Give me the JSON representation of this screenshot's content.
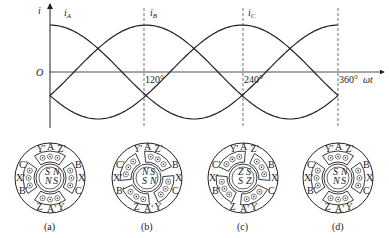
{
  "waveform": {
    "y_axis_label": "i",
    "x_axis_label": "ωt",
    "origin_label": "O",
    "curves": [
      {
        "name": "i_A",
        "label_main": "i",
        "label_sub": "A",
        "phase_deg": 0
      },
      {
        "name": "i_B",
        "label_main": "i",
        "label_sub": "B",
        "phase_deg": 120
      },
      {
        "name": "i_C",
        "label_main": "i",
        "label_sub": "C",
        "phase_deg": 240
      }
    ],
    "ticks": [
      "120°",
      "240°",
      "360°"
    ],
    "color": "#222222"
  },
  "motors": [
    {
      "caption": "(a)",
      "rotor_labels": [
        "S",
        "N",
        "N",
        "S"
      ],
      "stator_labels": {
        "top_left": "Y'",
        "top": "A",
        "top_right": "Z'",
        "right_top": "B",
        "right": "X",
        "right_bottom": "C",
        "bottom_right": "Y",
        "bottom": "A'",
        "bottom_left": "Z",
        "left_bottom": "B'",
        "left": "X'",
        "left_top": "C'"
      }
    },
    {
      "caption": "(b)",
      "rotor_labels": [
        "N",
        "S",
        "S",
        "N"
      ],
      "stator_labels": {
        "top_left": "Y'",
        "top": "A",
        "top_right": "Z'",
        "right_top": "B",
        "right": "X",
        "right_bottom": "C",
        "bottom_right": "Y",
        "bottom": "A'",
        "bottom_left": "Z",
        "left_bottom": "B'",
        "left": "X'",
        "left_top": "C'"
      }
    },
    {
      "caption": "(c)",
      "rotor_labels": [
        "Z",
        "S",
        "S",
        "Z"
      ],
      "stator_labels": {
        "top_left": "Y'",
        "top": "A",
        "top_right": "Z'",
        "right_top": "B",
        "right": "X",
        "right_bottom": "C",
        "bottom_right": "Y",
        "bottom": "A'",
        "bottom_left": "Z",
        "left_bottom": "B'",
        "left": "X'",
        "left_top": "C'"
      }
    },
    {
      "caption": "(d)",
      "rotor_labels": [
        "S",
        "N",
        "N",
        "S"
      ],
      "stator_labels": {
        "top_left": "Y'",
        "top": "A",
        "top_right": "Z'",
        "right_top": "B",
        "right": "X",
        "right_bottom": "C",
        "bottom_right": "Y",
        "bottom": "A'",
        "bottom_left": "Z",
        "left_bottom": "B'",
        "left": "X'",
        "left_top": "C'"
      }
    }
  ]
}
